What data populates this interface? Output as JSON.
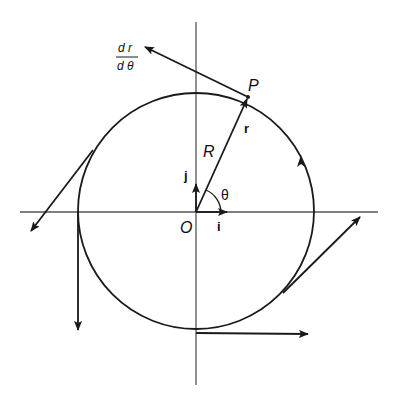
{
  "diagram": {
    "colors": {
      "stroke": "#1a1a1a",
      "axis": "#555555",
      "background": "#ffffff"
    },
    "labels": {
      "origin": "O",
      "point": "P",
      "radius": "R",
      "position_vector": "r",
      "unit_i": "i",
      "unit_j": "j",
      "angle": "θ",
      "derivative_numerator": "d r",
      "derivative_denominator": "d θ"
    },
    "direction_of_motion": "counterclockwise"
  }
}
